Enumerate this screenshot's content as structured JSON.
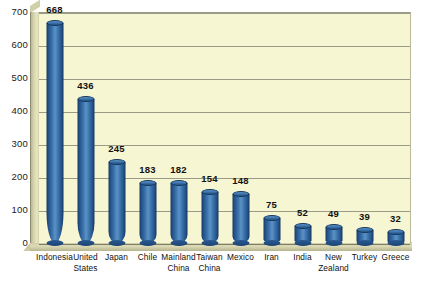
{
  "chart_data": {
    "type": "bar",
    "title": "",
    "subtitle": "",
    "xlabel": "",
    "ylabel": "",
    "ylim": [
      0,
      700
    ],
    "ytick_step": 100,
    "yticks": [
      "700",
      "600",
      "500",
      "400",
      "300",
      "200",
      "100",
      "0"
    ],
    "grid": true,
    "legend": null,
    "legend_position": "none",
    "style": "3d-cylinder",
    "categories": [
      "Indonesia",
      "United States",
      "Japan",
      "Chile",
      "Mainland China",
      "Taiwan China",
      "Mexico",
      "Iran",
      "India",
      "New Zealand",
      "Turkey",
      "Greece"
    ],
    "category_lines": [
      [
        "Indonesia"
      ],
      [
        "United",
        "States"
      ],
      [
        "Japan"
      ],
      [
        "Chile"
      ],
      [
        "Mainland",
        "China"
      ],
      [
        "Taiwan",
        "China"
      ],
      [
        "Mexico"
      ],
      [
        "Iran"
      ],
      [
        "India"
      ],
      [
        "New",
        "Zealand"
      ],
      [
        "Turkey"
      ],
      [
        "Greece"
      ]
    ],
    "values": [
      668,
      436,
      245,
      183,
      182,
      154,
      148,
      75,
      52,
      49,
      39,
      32
    ],
    "value_labels": [
      "668",
      "436",
      "245",
      "183",
      "182",
      "154",
      "148",
      "75",
      "52",
      "49",
      "39",
      "32"
    ]
  },
  "colors": {
    "plot_background": "#f7f6d2",
    "page_background": "#ffffff",
    "bar_fill": "#3d74ad",
    "bar_edge": "#173a63",
    "bar_highlight": "#5b93c6",
    "gridline": "#9a9a86",
    "wall_3d": "#d6d5ad",
    "floor_3d": "#ccca9f",
    "text": "#111111"
  }
}
